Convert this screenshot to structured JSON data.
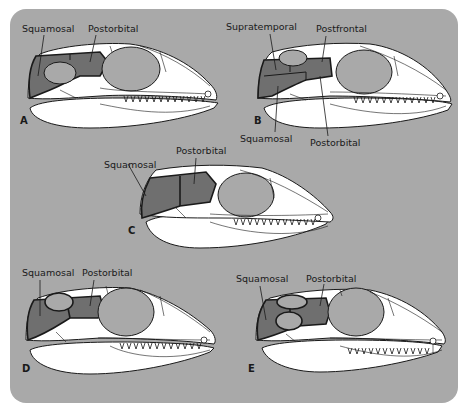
{
  "figure": {
    "background_color": "#a9a9a9",
    "skull_color": "#ffffff",
    "highlight_bone_color": "#6f6f6f",
    "fenestra_color": "#a9a9a9",
    "outline_color": "#1a1a1a"
  },
  "panels": [
    {
      "letter": "A",
      "labels": [
        "Squamosal",
        "Postorbital"
      ]
    },
    {
      "letter": "B",
      "labels": [
        "Supratemporal",
        "Postfrontal",
        "Squamosal",
        "Postorbital"
      ]
    },
    {
      "letter": "C",
      "labels": [
        "Squamosal",
        "Postorbital"
      ]
    },
    {
      "letter": "D",
      "labels": [
        "Squamosal",
        "Postorbital"
      ]
    },
    {
      "letter": "E",
      "labels": [
        "Squamosal",
        "Postorbital"
      ]
    }
  ]
}
